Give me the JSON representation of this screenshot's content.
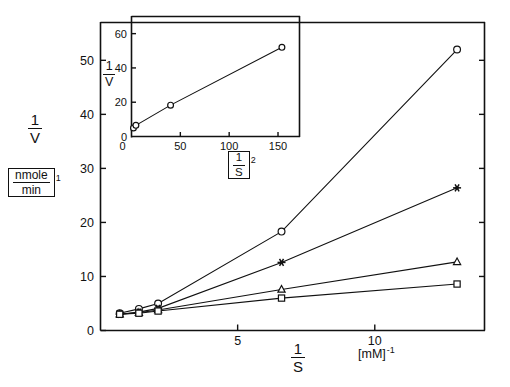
{
  "figure": {
    "background_color": "#ffffff",
    "ink_color": "#111111"
  },
  "chart_data": [
    {
      "id": "main",
      "type": "line",
      "title": "",
      "subtitle": "",
      "xlabel_numerator": "1",
      "xlabel_denominator": "S",
      "xlabel_units_open": "[",
      "xlabel_units_text": "mM",
      "xlabel_units_close": "]",
      "xlabel_units_exponent": "-1",
      "ylabel_numerator": "1",
      "ylabel_denominator": "V",
      "ylabel_units_numerator": "nmole",
      "ylabel_units_denominator": "min",
      "ylabel_units_exponent": "1",
      "xlim": [
        0,
        14
      ],
      "ylim": [
        0,
        57
      ],
      "grid": false,
      "legend": "none",
      "xticks": [
        5,
        10
      ],
      "xticklabels": [
        "5",
        "10"
      ],
      "yticks": [
        0,
        10,
        20,
        30,
        40,
        50
      ],
      "yticklabels": [
        "0",
        "10",
        "20",
        "30",
        "40",
        "50"
      ],
      "series": [
        {
          "name": "series-circle",
          "marker": "open-circle",
          "x": [
            0.7,
            1.4,
            2.1,
            6.6,
            13.0
          ],
          "y": [
            3.2,
            4.0,
            5.0,
            18.3,
            52.0
          ]
        },
        {
          "name": "series-star",
          "marker": "solid-star",
          "x": [
            0.7,
            1.4,
            2.1,
            6.6,
            13.0
          ],
          "y": [
            3.0,
            3.4,
            4.1,
            12.6,
            26.4
          ]
        },
        {
          "name": "series-triangle",
          "marker": "open-triangle",
          "x": [
            0.7,
            1.4,
            2.1,
            6.6,
            13.0
          ],
          "y": [
            3.0,
            3.3,
            3.8,
            7.6,
            12.7
          ]
        },
        {
          "name": "series-square",
          "marker": "open-square",
          "x": [
            0.7,
            1.4,
            2.1,
            6.6,
            13.0
          ],
          "y": [
            3.0,
            3.2,
            3.6,
            6.0,
            8.6
          ]
        }
      ]
    },
    {
      "id": "inset",
      "type": "scatter",
      "title": "",
      "xlabel_bracket_open": "[",
      "xlabel_numerator": "1",
      "xlabel_denominator": "S",
      "xlabel_bracket_close": "]",
      "xlabel_exponent": "2",
      "ylabel_numerator": "1",
      "ylabel_denominator": "V",
      "xlim": [
        0,
        172
      ],
      "ylim": [
        0,
        70
      ],
      "grid": false,
      "legend": "none",
      "xticks": [
        0,
        50,
        100,
        150
      ],
      "xticklabels": [
        "0",
        "50",
        "100",
        "150"
      ],
      "yticks": [
        0,
        20,
        40,
        60
      ],
      "yticklabels": [
        "0",
        "20",
        "40",
        "60"
      ],
      "series": [
        {
          "name": "inset-series-circle",
          "marker": "open-circle",
          "x": [
            2.0,
            4.5,
            40.0,
            154.0
          ],
          "y": [
            5.0,
            6.5,
            18.3,
            52.0
          ]
        }
      ]
    }
  ]
}
